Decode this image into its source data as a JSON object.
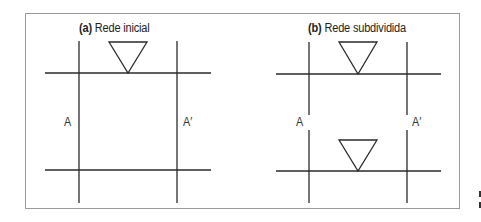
{
  "panel_a": {
    "tag": "(a)",
    "title": "Rede inicial",
    "label_left": "A",
    "label_right": "A′"
  },
  "panel_b": {
    "tag": "(b)",
    "title": "Rede subdividida",
    "label_left": "A",
    "label_right": "A′"
  },
  "colors": {
    "line": "#2a2a2a",
    "frame": "#9a9a9a"
  }
}
